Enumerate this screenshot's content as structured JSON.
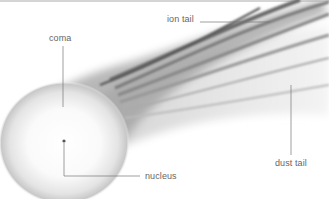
{
  "diagram": {
    "labels": {
      "coma": "coma",
      "ion_tail": "ion tail",
      "nucleus": "nucleus",
      "dust_tail": "dust tail"
    },
    "colors": {
      "label_text": "#666666",
      "leader_line": "#777777",
      "frame_line": "#999999",
      "tail_dark": "#555555",
      "background": "#ffffff"
    }
  }
}
